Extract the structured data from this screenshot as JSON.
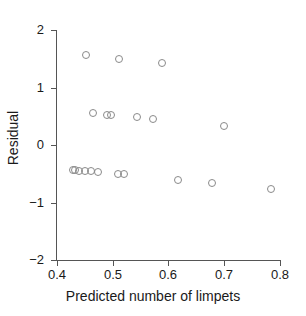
{
  "chart_data": {
    "type": "scatter",
    "title": "",
    "xlabel": "Predicted number of limpets",
    "ylabel": "Residual",
    "xlim": [
      0.4,
      0.8
    ],
    "ylim": [
      -2,
      2
    ],
    "grid": false,
    "legend": null,
    "marker": "open-circle",
    "xticks": [
      0.4,
      0.5,
      0.6,
      0.7,
      0.8
    ],
    "xtick_labels": [
      "0.4",
      "0.5",
      "0.6",
      "0.7",
      "0.8"
    ],
    "yticks": [
      2,
      1,
      0,
      -1,
      -2
    ],
    "ytick_labels": [
      "2",
      "1",
      "0",
      "−1",
      "−2"
    ],
    "points": [
      {
        "x": 0.452,
        "y": 1.56
      },
      {
        "x": 0.511,
        "y": 1.5
      },
      {
        "x": 0.588,
        "y": 1.43
      },
      {
        "x": 0.465,
        "y": 0.56
      },
      {
        "x": 0.489,
        "y": 0.53
      },
      {
        "x": 0.497,
        "y": 0.52
      },
      {
        "x": 0.544,
        "y": 0.49
      },
      {
        "x": 0.572,
        "y": 0.46
      },
      {
        "x": 0.7,
        "y": 0.33
      },
      {
        "x": 0.428,
        "y": -0.43
      },
      {
        "x": 0.433,
        "y": -0.44
      },
      {
        "x": 0.44,
        "y": -0.45
      },
      {
        "x": 0.45,
        "y": -0.46
      },
      {
        "x": 0.461,
        "y": -0.46
      },
      {
        "x": 0.473,
        "y": -0.47
      },
      {
        "x": 0.509,
        "y": -0.5
      },
      {
        "x": 0.521,
        "y": -0.51
      },
      {
        "x": 0.617,
        "y": -0.6
      },
      {
        "x": 0.678,
        "y": -0.66
      },
      {
        "x": 0.784,
        "y": -0.76
      }
    ]
  },
  "axes": {
    "y_title": "Residual",
    "x_title": "Predicted number of limpets"
  }
}
